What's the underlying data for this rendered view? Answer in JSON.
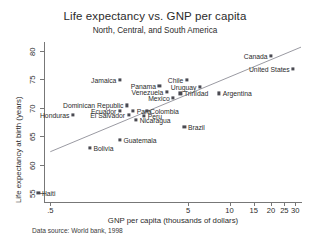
{
  "chart_data": {
    "type": "scatter",
    "title": "Life expectancy vs. GNP per capita",
    "subtitle": "North, Central, and South America",
    "xlabel": "GNP per capita (thousands of dollars)",
    "ylabel": "Life expectancy at birth (years)",
    "source": "Data source:  World bank, 1998",
    "xscale": "log",
    "xticks": [
      0.5,
      5,
      10,
      15,
      20,
      25,
      30
    ],
    "xticklabels": [
      ".5",
      "5",
      "10",
      "15",
      "20",
      "25",
      "30"
    ],
    "yticks": [
      55,
      60,
      65,
      70,
      75,
      80
    ],
    "yticklabels": [
      "55",
      "60",
      "65",
      "70",
      "75",
      "80"
    ],
    "xlim": [
      0.45,
      33
    ],
    "ylim": [
      53.5,
      81.5
    ],
    "grid": false,
    "legend": "none",
    "has_fit_line": true,
    "fit_line": {
      "x_start": 0.5,
      "y_start": 62.3,
      "x_end": 33,
      "y_end": 80.6
    },
    "points": [
      {
        "name": "Canada",
        "x": 20.0,
        "y": 79.1,
        "label_side": "left"
      },
      {
        "name": "United States",
        "x": 29.0,
        "y": 76.8,
        "label_side": "left"
      },
      {
        "name": "Jamaica",
        "x": 1.6,
        "y": 74.8,
        "label_side": "left"
      },
      {
        "name": "Chile",
        "x": 4.9,
        "y": 74.9,
        "label_side": "left"
      },
      {
        "name": "Panama",
        "x": 3.1,
        "y": 73.8,
        "label_side": "left"
      },
      {
        "name": "Uruguay",
        "x": 6.1,
        "y": 73.6,
        "label_side": "left"
      },
      {
        "name": "Venezuela",
        "x": 3.5,
        "y": 72.7,
        "label_side": "left"
      },
      {
        "name": "Trinidad",
        "x": 4.4,
        "y": 72.5,
        "label_side": "right"
      },
      {
        "name": "Argentina",
        "x": 8.4,
        "y": 72.5,
        "label_side": "right"
      },
      {
        "name": "Mexico",
        "x": 3.9,
        "y": 71.7,
        "label_side": "left"
      },
      {
        "name": "Dominican Republic",
        "x": 1.8,
        "y": 70.4,
        "label_side": "left"
      },
      {
        "name": "Ecuador",
        "x": 1.6,
        "y": 69.5,
        "label_side": "left"
      },
      {
        "name": "Para",
        "x": 2.0,
        "y": 69.5,
        "label_side": "right"
      },
      {
        "name": "Colombia",
        "x": 2.5,
        "y": 69.5,
        "label_side": "right"
      },
      {
        "name": "Honduras",
        "x": 0.73,
        "y": 68.8,
        "label_side": "left"
      },
      {
        "name": "El Salvador",
        "x": 1.85,
        "y": 68.8,
        "label_side": "left"
      },
      {
        "name": "Peru",
        "x": 2.4,
        "y": 68.6,
        "label_side": "right"
      },
      {
        "name": "Nicaragua",
        "x": 2.1,
        "y": 67.8,
        "label_side": "right"
      },
      {
        "name": "Brazil",
        "x": 4.7,
        "y": 66.7,
        "label_side": "right"
      },
      {
        "name": "Guatemala",
        "x": 1.6,
        "y": 64.3,
        "label_side": "right"
      },
      {
        "name": "Bolivia",
        "x": 0.97,
        "y": 62.9,
        "label_side": "right"
      },
      {
        "name": "Haiti",
        "x": 0.41,
        "y": 55.1,
        "label_side": "right"
      }
    ]
  }
}
